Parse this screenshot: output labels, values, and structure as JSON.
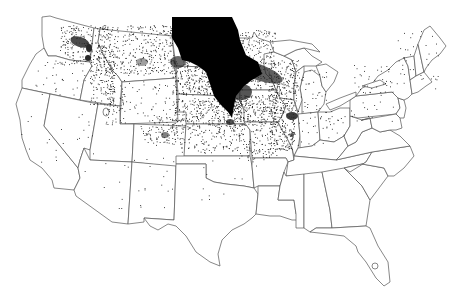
{
  "map": {
    "title": "",
    "type": "dot-density",
    "region": "Contiguous United States",
    "colors": {
      "background": "#ffffff",
      "border": "#555555",
      "dots": "#1a1a1a",
      "dense": "#000000"
    },
    "core_region": {
      "description": "Heavy concentration: North Dakota, eastern South Dakota, western Minnesota, northwest Iowa along Missouri River",
      "path": "M172,17 L232,17 L238,30 L240,40 L246,55 L258,62 L262,74 L252,80 L244,86 L236,96 L234,106 L232,118 L228,112 L220,104 L214,96 L210,84 L206,72 L198,66 L190,62 L182,60 L178,48 L172,38 Z"
    },
    "secondary_blobs": [
      {
        "name": "minnesota-wisconsin-band",
        "cx": 258,
        "cy": 72,
        "rx": 26,
        "ry": 8,
        "rotate": 20,
        "opacity": 0.75
      },
      {
        "name": "southwest-minnesota",
        "cx": 242,
        "cy": 92,
        "rx": 10,
        "ry": 8,
        "rotate": 0,
        "opacity": 0.8
      },
      {
        "name": "montana-east",
        "cx": 178,
        "cy": 62,
        "rx": 8,
        "ry": 6,
        "rotate": 0,
        "opacity": 0.7
      },
      {
        "name": "chicago",
        "cx": 292,
        "cy": 116,
        "rx": 6,
        "ry": 4,
        "rotate": 0,
        "opacity": 0.9
      },
      {
        "name": "east-washington",
        "cx": 80,
        "cy": 42,
        "rx": 10,
        "ry": 5,
        "rotate": 20,
        "opacity": 0.85
      },
      {
        "name": "spokane",
        "cx": 88,
        "cy": 58,
        "rx": 3,
        "ry": 3,
        "rotate": 0,
        "opacity": 1
      },
      {
        "name": "northern-idaho",
        "cx": 89,
        "cy": 48,
        "rx": 3,
        "ry": 4,
        "rotate": 0,
        "opacity": 1
      },
      {
        "name": "central-montana",
        "cx": 142,
        "cy": 62,
        "rx": 6,
        "ry": 4,
        "rotate": 0,
        "opacity": 0.45
      },
      {
        "name": "denver",
        "cx": 165,
        "cy": 135,
        "rx": 4,
        "ry": 3,
        "rotate": 0,
        "opacity": 0.6
      },
      {
        "name": "nebraska-east",
        "cx": 230,
        "cy": 122,
        "rx": 4,
        "ry": 3,
        "rotate": 0,
        "opacity": 0.8
      },
      {
        "name": "st-louis",
        "cx": 292,
        "cy": 135,
        "rx": 2,
        "ry": 2,
        "rotate": 0,
        "opacity": 0.8
      }
    ],
    "dot_fields": [
      {
        "name": "montana",
        "x": 95,
        "y": 25,
        "w": 80,
        "h": 50,
        "count": 420,
        "seed": 3
      },
      {
        "name": "idaho",
        "x": 90,
        "y": 45,
        "w": 25,
        "h": 60,
        "count": 160,
        "seed": 5
      },
      {
        "name": "washington-east",
        "x": 60,
        "y": 25,
        "w": 32,
        "h": 40,
        "count": 140,
        "seed": 7
      },
      {
        "name": "south-dakota-west",
        "x": 172,
        "y": 60,
        "w": 45,
        "h": 35,
        "count": 260,
        "seed": 11
      },
      {
        "name": "nebraska",
        "x": 172,
        "y": 98,
        "w": 70,
        "h": 30,
        "count": 330,
        "seed": 13
      },
      {
        "name": "iowa",
        "x": 232,
        "y": 95,
        "w": 45,
        "h": 30,
        "count": 260,
        "seed": 17
      },
      {
        "name": "minnesota-east",
        "x": 240,
        "y": 30,
        "w": 35,
        "h": 60,
        "count": 210,
        "seed": 19
      },
      {
        "name": "wisconsin",
        "x": 268,
        "y": 60,
        "w": 30,
        "h": 45,
        "count": 210,
        "seed": 23
      },
      {
        "name": "illinois",
        "x": 270,
        "y": 105,
        "w": 25,
        "h": 45,
        "count": 200,
        "seed": 29
      },
      {
        "name": "kansas",
        "x": 180,
        "y": 128,
        "w": 60,
        "h": 25,
        "count": 120,
        "seed": 31
      },
      {
        "name": "missouri",
        "x": 238,
        "y": 125,
        "w": 40,
        "h": 35,
        "count": 110,
        "seed": 37
      },
      {
        "name": "colorado",
        "x": 140,
        "y": 115,
        "w": 40,
        "h": 30,
        "count": 110,
        "seed": 41
      },
      {
        "name": "wyoming",
        "x": 120,
        "y": 80,
        "w": 50,
        "h": 35,
        "count": 45,
        "seed": 43
      },
      {
        "name": "utah-idaho",
        "x": 105,
        "y": 85,
        "w": 20,
        "h": 40,
        "count": 55,
        "seed": 47
      },
      {
        "name": "oregon",
        "x": 35,
        "y": 60,
        "w": 50,
        "h": 35,
        "count": 35,
        "seed": 53
      },
      {
        "name": "nevada",
        "x": 60,
        "y": 100,
        "w": 40,
        "h": 60,
        "count": 12,
        "seed": 59
      },
      {
        "name": "arizona-nm",
        "x": 80,
        "y": 155,
        "w": 95,
        "h": 55,
        "count": 25,
        "seed": 61
      },
      {
        "name": "michigan",
        "x": 298,
        "y": 70,
        "w": 30,
        "h": 45,
        "count": 40,
        "seed": 67
      },
      {
        "name": "indiana-ohio",
        "x": 295,
        "y": 110,
        "w": 50,
        "h": 35,
        "count": 40,
        "seed": 71
      },
      {
        "name": "new-york",
        "x": 350,
        "y": 65,
        "w": 45,
        "h": 30,
        "count": 40,
        "seed": 73
      },
      {
        "name": "new-england",
        "x": 395,
        "y": 30,
        "w": 45,
        "h": 60,
        "count": 40,
        "seed": 79
      },
      {
        "name": "pennsylvania",
        "x": 350,
        "y": 100,
        "w": 45,
        "h": 25,
        "count": 15,
        "seed": 83
      },
      {
        "name": "oklahoma-texas",
        "x": 200,
        "y": 160,
        "w": 60,
        "h": 40,
        "count": 12,
        "seed": 89
      },
      {
        "name": "california",
        "x": 20,
        "y": 100,
        "w": 45,
        "h": 70,
        "count": 10,
        "seed": 97
      }
    ]
  }
}
